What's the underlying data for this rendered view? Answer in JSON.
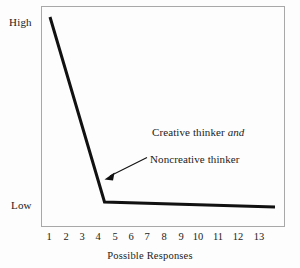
{
  "chart_data": {
    "type": "line",
    "title": "",
    "subtitle": "",
    "xlabel": "Possible Responses",
    "ylabel": "",
    "xtick_labels": [
      "1",
      "2",
      "3",
      "4",
      "5",
      "6",
      "7",
      "8",
      "9",
      "10",
      "11",
      "12",
      "13"
    ],
    "ytick_labels": [
      "High",
      "Low"
    ],
    "ylim_labels": {
      "top": "High",
      "bottom": "Low"
    },
    "grid": false,
    "legend": "none",
    "series": [
      {
        "name": "Creative thinker and Noncreative thinker",
        "x": [
          1,
          4.5,
          13.5
        ],
        "y_label_scale": [
          "High",
          "Low",
          "Low"
        ],
        "y_fraction": [
          1.0,
          0.105,
          0.08
        ],
        "color": "#111111",
        "line_width": 3
      }
    ],
    "annotations": [
      {
        "id": "creative-thinker",
        "text_plain": "Creative thinker and",
        "text_prefix": "Creative thinker ",
        "text_italic": "and",
        "x_px": 152,
        "y_px": 126
      },
      {
        "id": "noncreative-thinker",
        "text_plain": "Noncreative thinker",
        "x_px": 150,
        "y_px": 153,
        "arrow": {
          "from_x": 147,
          "from_y": 158,
          "to_x": 105,
          "to_y": 179,
          "head": "filled-triangle"
        }
      }
    ]
  },
  "axes": {
    "y": {
      "high_label": "High",
      "low_label": "Low"
    },
    "x": {
      "title": "Possible Responses",
      "ticks": [
        {
          "label": "1",
          "x_px": 49
        },
        {
          "label": "2",
          "x_px": 66
        },
        {
          "label": "3",
          "x_px": 82
        },
        {
          "label": "4",
          "x_px": 98
        },
        {
          "label": "5",
          "x_px": 115
        },
        {
          "label": "6",
          "x_px": 131
        },
        {
          "label": "7",
          "x_px": 147
        },
        {
          "label": "8",
          "x_px": 164
        },
        {
          "label": "9",
          "x_px": 181
        },
        {
          "label": "10",
          "x_px": 198
        },
        {
          "label": "11",
          "x_px": 218
        },
        {
          "label": "12",
          "x_px": 238
        },
        {
          "label": "13",
          "x_px": 259
        }
      ]
    }
  },
  "annotations": {
    "creative_prefix": "Creative thinker ",
    "creative_italic": "and",
    "noncreative": "Noncreative thinker"
  },
  "colors": {
    "line": "#111111",
    "frame": "#a8a8a8",
    "text": "#1b1b1b",
    "background": "#fdfdfd"
  }
}
